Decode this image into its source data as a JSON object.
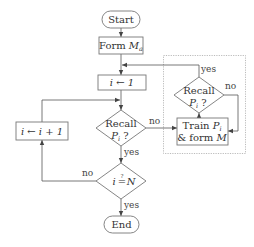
{
  "diagram": {
    "type": "flowchart",
    "nodes": {
      "start": {
        "label": "Start",
        "shape": "terminator"
      },
      "form_ma": {
        "label": "Form ",
        "math": "M",
        "sub": "a",
        "shape": "process"
      },
      "init_i": {
        "label": "i ← 1",
        "shape": "process"
      },
      "recall_main": {
        "line1": "Recall",
        "line2_math": "P",
        "line2_sub": "i",
        "line2_suffix": " ?",
        "shape": "decision"
      },
      "increment": {
        "label": "i ← i + 1",
        "shape": "process"
      },
      "check_n": {
        "label_left": "i",
        "op": "=",
        "op_over": "?",
        "label_right": "N",
        "shape": "decision"
      },
      "end": {
        "label": "End",
        "shape": "terminator"
      },
      "recall_inner": {
        "line1": "Recall",
        "line2_math": "P",
        "line2_sub": "i",
        "line2_suffix": " ?",
        "shape": "decision"
      },
      "train": {
        "line1_prefix": "Train ",
        "line1_math": "P",
        "line1_sub": "i",
        "line2_prefix": "& form ",
        "line2_math": "M",
        "shape": "process"
      }
    },
    "edge_labels": {
      "recall_main_no": "no",
      "recall_main_yes": "yes",
      "check_n_no": "no",
      "check_n_yes": "yes",
      "recall_inner_yes": "yes",
      "recall_inner_no": "no"
    },
    "group": {
      "style": "dotted",
      "contains": [
        "recall_inner",
        "train"
      ]
    },
    "colors": {
      "stroke": "#777777",
      "text": "#333333",
      "group_border": "#aaaaaa"
    }
  }
}
